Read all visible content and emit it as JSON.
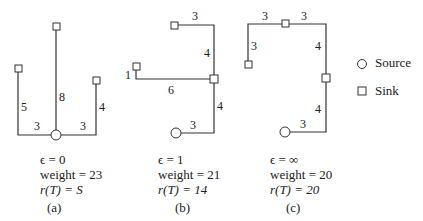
{
  "panels": [
    {
      "id": "a",
      "label": "(a)",
      "epsilon": "ϵ = 0",
      "weight": "weight = 23",
      "radius": "r(T) = S",
      "edges": [
        "5",
        "3",
        "8",
        "3",
        "4"
      ]
    },
    {
      "id": "b",
      "label": "(b)",
      "epsilon": "ϵ = 1",
      "weight": "weight = 21",
      "radius": "r(T) = 14",
      "edges": [
        "3",
        "4",
        "1",
        "6",
        "4",
        "3"
      ]
    },
    {
      "id": "c",
      "label": "(c)",
      "epsilon": "ϵ = ∞",
      "weight": "weight = 20",
      "radius": "r(T) = 20",
      "edges": [
        "3",
        "3",
        "3",
        "4",
        "4",
        "3"
      ]
    }
  ],
  "legend": {
    "source_label": "Source",
    "sink_label": "Sink"
  }
}
